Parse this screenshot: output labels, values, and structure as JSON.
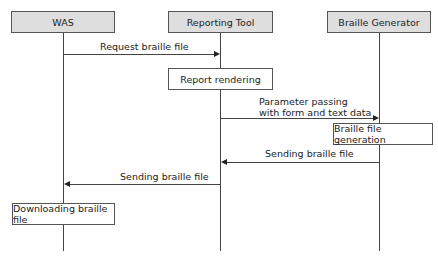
{
  "diagram": {
    "type": "sequence",
    "participants": [
      {
        "id": "was",
        "label": "WAS"
      },
      {
        "id": "tool",
        "label": "Reporting Tool"
      },
      {
        "id": "gen",
        "label": "Braille Generator"
      }
    ],
    "activities": [
      {
        "on": "tool",
        "label": "Report rendering"
      },
      {
        "on": "gen",
        "label": "Braille file generation"
      },
      {
        "on": "was",
        "label": "Downloading braille file"
      }
    ],
    "messages": [
      {
        "from": "was",
        "to": "tool",
        "label": "Request braille file"
      },
      {
        "from": "tool",
        "to": "gen",
        "label_line1": "Parameter passing",
        "label_line2": "with form and text data"
      },
      {
        "from": "gen",
        "to": "tool",
        "label": "Sending braille file"
      },
      {
        "from": "tool",
        "to": "was",
        "label": "Sending braille file"
      }
    ],
    "colors": {
      "actor_fill": "#dedede",
      "line": "#444444"
    }
  }
}
